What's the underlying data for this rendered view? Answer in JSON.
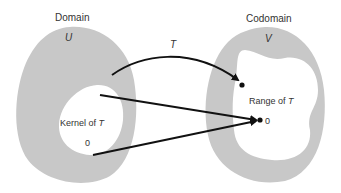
{
  "figure": {
    "domain": {
      "title": "Domain",
      "set_name": "U",
      "kernel_label_prefix": "Kernel of ",
      "kernel_label_var": "T",
      "zero": "0"
    },
    "codomain": {
      "title": "Codomain",
      "set_name": "V",
      "range_label_prefix": "Range of ",
      "range_label_var": "T",
      "zero": "0"
    },
    "map": {
      "name": "T"
    },
    "colors": {
      "region_fill": "#c8c8c8",
      "arrow": "#111111",
      "text": "#333333",
      "background": "#ffffff"
    }
  }
}
